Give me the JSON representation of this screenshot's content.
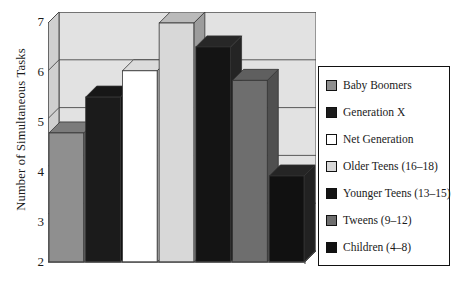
{
  "chart_data": {
    "type": "bar",
    "title": "",
    "xlabel": "",
    "ylabel": "Number of Simultaneous Tasks",
    "ylim": [
      2,
      7
    ],
    "yticks": [
      "7",
      "6",
      "5",
      "4",
      "3",
      "2"
    ],
    "grid": true,
    "legend_position": "right",
    "style": "3d-bar",
    "categories": [
      "Baby Boomers",
      "Generation X",
      "Net Generation",
      "Older Teens (16–18)",
      "Younger Teens (13–15)",
      "Tweens (9–12)",
      "Children (4–8)"
    ],
    "values": [
      4.7,
      5.45,
      6.0,
      7.0,
      6.5,
      5.8,
      3.8
    ],
    "colors": [
      "#8f8f8f",
      "#1b1b1b",
      "#ffffff",
      "#d8d8d8",
      "#141414",
      "#6e6e6e",
      "#111111"
    ]
  },
  "legend": {
    "items": [
      {
        "label": "Baby Boomers",
        "color": "#8f8f8f"
      },
      {
        "label": "Generation X",
        "color": "#1b1b1b"
      },
      {
        "label": "Net Generation",
        "color": "#ffffff"
      },
      {
        "label": "Older Teens (16–18)",
        "color": "#d8d8d8"
      },
      {
        "label": "Younger Teens (13–15)",
        "color": "#141414"
      },
      {
        "label": "Tweens (9–12)",
        "color": "#6e6e6e"
      },
      {
        "label": "Children (4–8)",
        "color": "#111111"
      }
    ]
  },
  "axis": {
    "y_title": "Number of Simultaneous Tasks",
    "y_ticks": [
      "7",
      "6",
      "5",
      "4",
      "3",
      "2"
    ]
  },
  "theme": {
    "panel_fill": "#e2e2e2",
    "panel_side": "#cfcfcf",
    "line": "#4a4a4a",
    "text": "#1a1a1a"
  }
}
